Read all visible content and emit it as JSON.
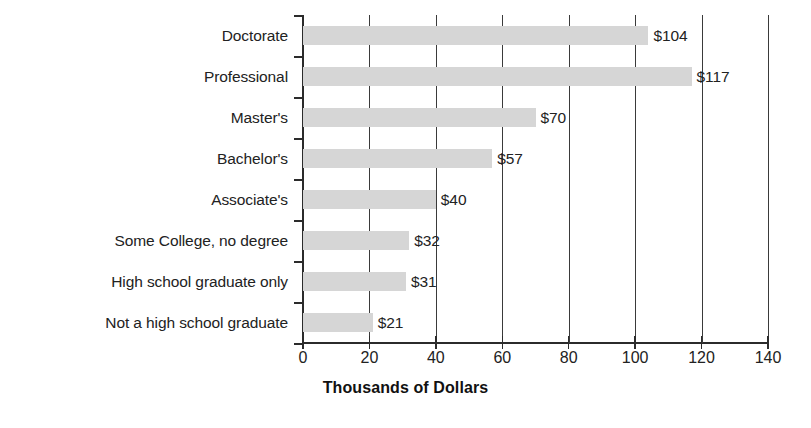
{
  "chart_data": {
    "type": "bar",
    "orientation": "horizontal",
    "title": "",
    "xlabel": "Thousands of Dollars",
    "ylabel": "",
    "xlim": [
      0,
      140
    ],
    "xticks": [
      0,
      20,
      40,
      60,
      80,
      100,
      120,
      140
    ],
    "xtick_labels": [
      "0",
      "20",
      "40",
      "60",
      "80",
      "100",
      "120",
      "140"
    ],
    "grid": true,
    "grid_axis": "x",
    "legend": false,
    "categories": [
      "Doctorate",
      "Professional",
      "Master's",
      "Bachelor's",
      "Associate's",
      "Some College, no degree",
      "High school graduate only",
      "Not a high school graduate"
    ],
    "values": [
      104,
      117,
      70,
      57,
      40,
      32,
      31,
      21
    ],
    "data_labels": [
      "$104",
      "$117",
      "$70",
      "$57",
      "$40",
      "$32",
      "$31",
      "$21"
    ],
    "bar_color": "#d6d6d6",
    "axis_color": "#2b2b2b",
    "text_color": "#222222"
  }
}
